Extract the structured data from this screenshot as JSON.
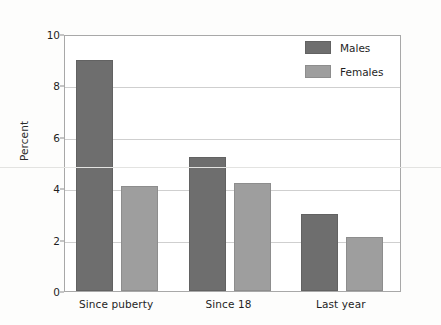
{
  "chart_data": {
    "type": "bar",
    "title": "",
    "xlabel": "",
    "ylabel": "Percent",
    "ylim": [
      0,
      10
    ],
    "yticks": [
      0,
      2,
      4,
      6,
      8,
      10
    ],
    "ytick_labels": [
      "0",
      "2",
      "4",
      "6",
      "8",
      "10"
    ],
    "grid": "horizontal",
    "legend_position": "top-right-inside",
    "categories": [
      "Since puberty",
      "Since 18",
      "Last year"
    ],
    "series": [
      {
        "name": "Males",
        "color": "#6e6e6e",
        "values": [
          9.0,
          5.2,
          3.0
        ]
      },
      {
        "name": "Females",
        "color": "#9e9e9e",
        "values": [
          4.1,
          4.2,
          2.1
        ]
      }
    ]
  },
  "legend": {
    "items": [
      {
        "label": "Males",
        "swatch_name": "legend-swatch-males"
      },
      {
        "label": "Females",
        "swatch_name": "legend-swatch-females"
      }
    ]
  },
  "axes": {
    "y_label": "Percent",
    "y_tick_labels": [
      "10",
      "8",
      "6",
      "4",
      "2",
      "0"
    ],
    "x_tick_labels": [
      "Since puberty",
      "Since 18",
      "Last year"
    ]
  }
}
